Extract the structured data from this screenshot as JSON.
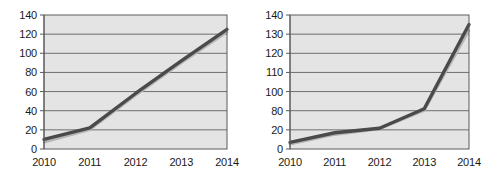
{
  "figure": {
    "background_color": "#ffffff",
    "panel_count": 2
  },
  "style": {
    "plot_background": "#e4e4e4",
    "gridline_color": "#6e6e6e",
    "axis_color": "#5a5a5a",
    "series_color": "#4a4a4a",
    "shadow_series_color": "#b4b4b4",
    "tick_label_color": "#1a1a1a"
  },
  "chart_data": [
    {
      "id": "left-chart",
      "type": "line",
      "title": "",
      "subtitle": "",
      "xlabel": "",
      "ylabel": "",
      "categories": [
        "2010",
        "2011",
        "2012",
        "2013",
        "2014"
      ],
      "x_tick_labels": [
        "2010",
        "2011",
        "2012",
        "2013",
        "2014"
      ],
      "y_tick_labels": [
        "0",
        "20",
        "40",
        "60",
        "80",
        "100",
        "120",
        "140"
      ],
      "y_tick_values": [
        0,
        20,
        40,
        60,
        80,
        100,
        120,
        140
      ],
      "y_axis_uniform": true,
      "ylim": [
        0,
        140
      ],
      "grid": true,
      "grid_axis": "y",
      "legend": false,
      "legend_position": "none",
      "series": [
        {
          "name": "series-1",
          "values": [
            10,
            22,
            58,
            92,
            125
          ]
        },
        {
          "name": "shadow",
          "values": [
            7,
            20,
            56,
            90,
            122
          ]
        }
      ],
      "annotations": []
    },
    {
      "id": "right-chart",
      "type": "line",
      "title": "",
      "subtitle": "",
      "xlabel": "",
      "ylabel": "",
      "categories": [
        "2010",
        "2011",
        "2012",
        "2013",
        "2014"
      ],
      "x_tick_labels": [
        "2010",
        "2011",
        "2012",
        "2013",
        "2014"
      ],
      "y_tick_labels": [
        "0",
        "20",
        "80",
        "100",
        "110",
        "120",
        "130",
        "140"
      ],
      "y_tick_values": [
        0,
        20,
        80,
        100,
        110,
        120,
        130,
        140
      ],
      "y_axis_uniform": false,
      "y_axis_note": "broken / non-linear scale",
      "ylim": [
        0,
        140
      ],
      "grid": true,
      "grid_axis": "y",
      "legend": false,
      "legend_position": "none",
      "series": [
        {
          "name": "series-1",
          "values": [
            7,
            17,
            25,
            82,
            135
          ]
        },
        {
          "name": "shadow",
          "values": [
            5,
            15,
            23,
            80,
            132
          ]
        }
      ],
      "annotations": []
    }
  ]
}
